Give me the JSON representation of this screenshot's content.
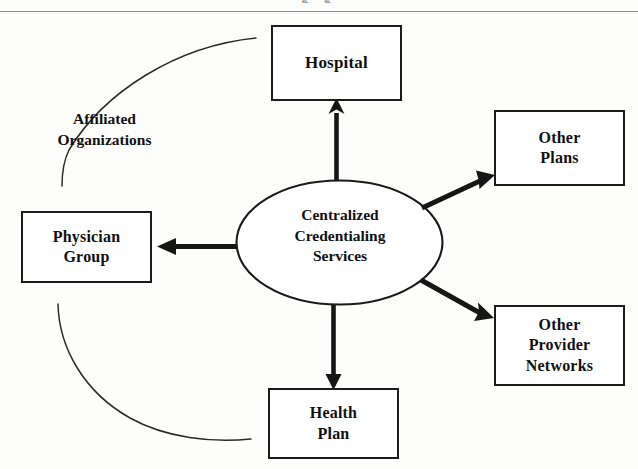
{
  "page": {
    "width": 638,
    "height": 469,
    "background_color": "#fdfdfc",
    "ink_color": "#111111",
    "rule_color": "#8d8d8d",
    "cut_off_text_fragment": "g            g"
  },
  "hub": {
    "shape": "ellipse",
    "lines": [
      "Centralized",
      "Credentialing",
      "Services"
    ],
    "line1": "Centralized",
    "line2": "Credentialing",
    "line3": "Services"
  },
  "nodes": [
    {
      "id": "hospital",
      "lines": [
        "Hospital"
      ],
      "line1": "Hospital",
      "line2": "",
      "line3": "",
      "position": "top"
    },
    {
      "id": "other-plans",
      "lines": [
        "Other",
        "Plans"
      ],
      "line1": "Other",
      "line2": "Plans",
      "line3": "",
      "position": "top-right"
    },
    {
      "id": "other-provider-networks",
      "lines": [
        "Other",
        "Provider",
        "Networks"
      ],
      "line1": "Other",
      "line2": "Provider",
      "line3": "Networks",
      "position": "bottom-right"
    },
    {
      "id": "health-plan",
      "lines": [
        "Health",
        "Plan"
      ],
      "line1": "Health",
      "line2": "Plan",
      "line3": "",
      "position": "bottom"
    },
    {
      "id": "physician-group",
      "lines": [
        "Physician",
        "Group"
      ],
      "line1": "Physician",
      "line2": "Group",
      "line3": "",
      "position": "left"
    }
  ],
  "annotation": {
    "lines": [
      "Affiliated",
      "Organizations"
    ],
    "line1": "Affiliated",
    "line2": "Organizations"
  },
  "connectors": [
    {
      "from": "hub",
      "to": "hospital",
      "style": "solid-thick-arrow",
      "direction": "up"
    },
    {
      "from": "hub",
      "to": "other-plans",
      "style": "solid-thick-arrow",
      "direction": "up-right"
    },
    {
      "from": "hub",
      "to": "other-provider-networks",
      "style": "solid-thick-arrow",
      "direction": "down-right"
    },
    {
      "from": "hub",
      "to": "health-plan",
      "style": "solid-thick-arrow",
      "direction": "down"
    },
    {
      "from": "hub",
      "to": "physician-group",
      "style": "solid-thick-arrow",
      "direction": "left"
    }
  ],
  "arcs": [
    {
      "id": "upper-arc",
      "style": "thin-curve",
      "spans": "hospital-to-affiliated-label"
    },
    {
      "id": "lower-arc",
      "style": "thin-curve",
      "spans": "affiliated-label-to-health-plan"
    }
  ]
}
